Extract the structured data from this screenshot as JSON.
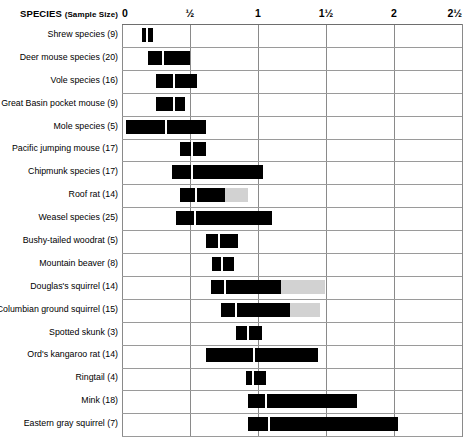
{
  "header": {
    "species_label": "SPECIES",
    "sample_size_label": "(Sample Size)"
  },
  "axis": {
    "ticks": [
      {
        "label": "0",
        "value": 0
      },
      {
        "label": "½",
        "value": 0.5
      },
      {
        "label": "1",
        "value": 1
      },
      {
        "label": "1½",
        "value": 1.5
      },
      {
        "label": "2",
        "value": 2
      },
      {
        "label": "2½",
        "value": 2.5
      }
    ],
    "min": 0,
    "max": 2.5
  },
  "colors": {
    "bar": "#000000",
    "bar_tail": "#d2d2d2",
    "median_marker": "#ffffff",
    "gridline": "#8a8a8a",
    "rowline": "#9a9a9a",
    "background": "#ffffff",
    "text": "#000000"
  },
  "chart_data": {
    "type": "bar",
    "title": "",
    "subtitle": "",
    "xlabel": "",
    "ylabel": "SPECIES (Sample Size)",
    "xlim": [
      0,
      2.5
    ],
    "grid": true,
    "legend": "none",
    "orientation": "horizontal",
    "encoding": "range bars with median divider; light gray segment = extended/uncertain range",
    "xtick_labels": [
      "0",
      "½",
      "1",
      "1½",
      "2",
      "2½"
    ],
    "xtick_values": [
      0,
      0.5,
      1,
      1.5,
      2,
      2.5
    ],
    "categories": [
      "Shrew species (9)",
      "Deer mouse species (20)",
      "Vole species (16)",
      "Great Basin pocket mouse (9)",
      "Mole species (5)",
      "Pacific jumping mouse (17)",
      "Chipmunk species (17)",
      "Roof rat (14)",
      "Weasel species (25)",
      "Bushy-tailed woodrat (5)",
      "Mountain beaver (8)",
      "Douglas's squirrel (14)",
      "Columbian ground squirrel (15)",
      "Spotted skunk (3)",
      "Ord's kangaroo rat (14)",
      "Ringtail (4)",
      "Mink (18)",
      "Eastern gray squirrel (7)"
    ],
    "rows": [
      {
        "label": "Shrew species (9)",
        "sample_size": 9,
        "start": 0.15,
        "median": 0.185,
        "end": 0.23,
        "tail_end": null
      },
      {
        "label": "Deer mouse species (20)",
        "sample_size": 20,
        "start": 0.19,
        "median": 0.305,
        "end": 0.5,
        "tail_end": null
      },
      {
        "label": "Vole species (16)",
        "sample_size": 16,
        "start": 0.25,
        "median": 0.385,
        "end": 0.55,
        "tail_end": null
      },
      {
        "label": "Great Basin pocket mouse (9)",
        "sample_size": 9,
        "start": 0.25,
        "median": 0.385,
        "end": 0.46,
        "tail_end": null
      },
      {
        "label": "Mole species (5)",
        "sample_size": 5,
        "start": 0.03,
        "median": 0.325,
        "end": 0.62,
        "tail_end": null
      },
      {
        "label": "Pacific jumping mouse (17)",
        "sample_size": 17,
        "start": 0.43,
        "median": 0.515,
        "end": 0.62,
        "tail_end": null
      },
      {
        "label": "Chipmunk species (17)",
        "sample_size": 17,
        "start": 0.37,
        "median": 0.515,
        "end": 1.04,
        "tail_end": null
      },
      {
        "label": "Roof rat (14)",
        "sample_size": 14,
        "start": 0.43,
        "median": 0.545,
        "end": 0.755,
        "tail_end": 0.93
      },
      {
        "label": "Weasel species (25)",
        "sample_size": 25,
        "start": 0.4,
        "median": 0.535,
        "end": 1.1,
        "tail_end": null
      },
      {
        "label": "Bushy-tailed woodrat (5)",
        "sample_size": 5,
        "start": 0.615,
        "median": 0.71,
        "end": 0.85,
        "tail_end": null
      },
      {
        "label": "Mountain beaver (8)",
        "sample_size": 8,
        "start": 0.665,
        "median": 0.735,
        "end": 0.82,
        "tail_end": null
      },
      {
        "label": "Douglas's squirrel (14)",
        "sample_size": 14,
        "start": 0.655,
        "median": 0.76,
        "end": 1.17,
        "tail_end": 1.49
      },
      {
        "label": "Columbian ground squirrel (15)",
        "sample_size": 15,
        "start": 0.73,
        "median": 0.835,
        "end": 1.235,
        "tail_end": 1.455
      },
      {
        "label": "Spotted skunk (3)",
        "sample_size": 3,
        "start": 0.835,
        "median": 0.925,
        "end": 1.03,
        "tail_end": null
      },
      {
        "label": "Ord's kangaroo rat (14)",
        "sample_size": 14,
        "start": 0.615,
        "median": 0.97,
        "end": 1.44,
        "tail_end": null
      },
      {
        "label": "Ringtail (4)",
        "sample_size": 4,
        "start": 0.91,
        "median": 0.965,
        "end": 1.06,
        "tail_end": null
      },
      {
        "label": "Mink (18)",
        "sample_size": 18,
        "start": 0.925,
        "median": 1.06,
        "end": 1.73,
        "tail_end": null
      },
      {
        "label": "Eastern gray squirrel (7)",
        "sample_size": 7,
        "start": 0.925,
        "median": 1.08,
        "end": 2.03,
        "tail_end": null
      }
    ]
  }
}
